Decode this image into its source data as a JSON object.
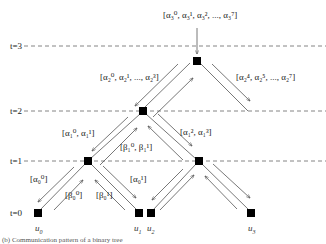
{
  "diagram": {
    "type": "tree-message-passing",
    "levels": [
      {
        "label": "t=3",
        "y": 46
      },
      {
        "label": "t=2",
        "y": 111
      },
      {
        "label": "t=1",
        "y": 161
      },
      {
        "label": "t=0",
        "y": 213
      }
    ],
    "nodes": [
      {
        "id": "root",
        "level": "t=3",
        "x": 197,
        "y": 61
      },
      {
        "id": "n2",
        "level": "t=2",
        "x": 143,
        "y": 111
      },
      {
        "id": "n1a",
        "level": "t=1",
        "x": 88,
        "y": 161
      },
      {
        "id": "n1b",
        "level": "t=1",
        "x": 199,
        "y": 161
      },
      {
        "id": "u0",
        "level": "t=0",
        "x": 38,
        "y": 213
      },
      {
        "id": "u1",
        "level": "t=0",
        "x": 139,
        "y": 213
      },
      {
        "id": "u2",
        "level": "t=0",
        "x": 151,
        "y": 213
      },
      {
        "id": "u3",
        "level": "t=0",
        "x": 251,
        "y": 213
      }
    ],
    "leaf_labels": {
      "u0": "u",
      "u0_sub": "0",
      "u1": "u",
      "u1_sub": "1",
      "u2": "u",
      "u2_sub": "2",
      "u3": "u",
      "u3_sub": "3"
    },
    "messages": {
      "top_input": "[α₃⁰, α₃¹, α₃², ..., α₃⁷]",
      "t3_left": "[α₂⁰, α₂¹, ..., α₂³]",
      "t3_right": "[α₂⁴, α₂⁵, ..., α₂⁷]",
      "t2_left": "[α₁⁰, α₁¹]",
      "t2_beta": "[β₁⁰, β₁¹]",
      "t2_right": "[α₁², α₁³]",
      "t1_left": "[α₀⁰]",
      "t1_beta0": "[β₀⁰]",
      "t1_beta1": "[β₀¹]",
      "t1_right": "[α₀¹]"
    },
    "caption": "(b) Communication pattern of a binary tree"
  },
  "colors": {
    "line": "#555555",
    "node": "#000000",
    "dash": "#666666",
    "text": "#222222"
  }
}
